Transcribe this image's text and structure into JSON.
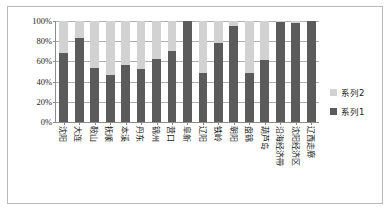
{
  "chart_data": {
    "type": "bar",
    "subtype": "stacked-100-percent",
    "title": "",
    "xlabel": "",
    "ylabel": "",
    "ylim": [
      0,
      100
    ],
    "ytick_labels": [
      "100%",
      "80%",
      "60%",
      "40%",
      "20%",
      "0%"
    ],
    "ytick_values": [
      100,
      80,
      60,
      40,
      20,
      0
    ],
    "grid": true,
    "legend_position": "right",
    "categories": [
      "沈阳",
      "大连",
      "鞍山",
      "抚顺",
      "本溪",
      "丹东",
      "锦州",
      "营口",
      "阜新",
      "辽阳",
      "铁岭",
      "朝阳",
      "盘锦",
      "葫芦岛",
      "沿海经济带",
      "沈阳经济区",
      "辽西走廊"
    ],
    "series": [
      {
        "name": "系列1",
        "color": "#5b5b5b",
        "values": [
          68,
          83,
          53,
          47,
          56,
          52,
          62,
          70,
          100,
          49,
          78,
          95,
          49,
          61,
          99,
          98,
          100
        ]
      },
      {
        "name": "系列2",
        "color": "#d2d2d2",
        "values": [
          32,
          17,
          47,
          53,
          44,
          48,
          38,
          30,
          0,
          51,
          22,
          5,
          51,
          39,
          1,
          2,
          0
        ]
      }
    ]
  },
  "legend": {
    "entries": [
      {
        "label": "系列2",
        "color": "#d2d2d2"
      },
      {
        "label": "系列1",
        "color": "#5b5b5b"
      }
    ]
  }
}
